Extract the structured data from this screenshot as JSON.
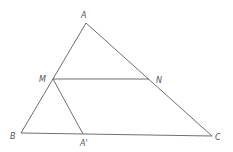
{
  "diagram": {
    "points": {
      "A": {
        "label": "A",
        "x": 86,
        "y": 23
      },
      "M": {
        "label": "M",
        "x": 53,
        "y": 79
      },
      "N": {
        "label": "N",
        "x": 149,
        "y": 79
      },
      "B": {
        "label": "B",
        "x": 21,
        "y": 133
      },
      "A1": {
        "label": "A'",
        "x": 83,
        "y": 134
      },
      "C": {
        "label": "C",
        "x": 212,
        "y": 136
      }
    },
    "segments": [
      [
        "A",
        "B"
      ],
      [
        "A",
        "C"
      ],
      [
        "B",
        "C"
      ],
      [
        "M",
        "N"
      ],
      [
        "M",
        "A1"
      ]
    ]
  }
}
